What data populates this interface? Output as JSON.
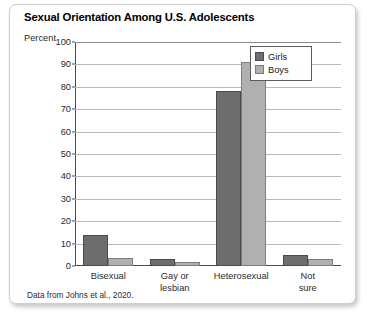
{
  "card": {
    "title": "Sexual Orientation Among U.S. Adolescents",
    "percent_label": "Percent",
    "source_note": "Data from Johns et al., 2020."
  },
  "chart_data": {
    "type": "bar",
    "title": "Sexual Orientation Among U.S. Adolescents",
    "xlabel": "",
    "ylabel": "Percent",
    "ylim": [
      0,
      100
    ],
    "ytick_step": 10,
    "yticks": [
      "100",
      "90",
      "80",
      "70",
      "60",
      "50",
      "40",
      "30",
      "20",
      "10",
      "0"
    ],
    "grid": true,
    "legend_position": "top-right",
    "categories": [
      "Bisexual",
      "Gay or\nlesbian",
      "Heterosexual",
      "Not sure"
    ],
    "series": [
      {
        "name": "Girls",
        "color": "#6d6d6d",
        "values": [
          14,
          3,
          78,
          5
        ]
      },
      {
        "name": "Boys",
        "color": "#b0b0b0",
        "values": [
          3.5,
          2,
          91,
          3
        ]
      }
    ],
    "annotation": "Data from Johns et al., 2020."
  }
}
